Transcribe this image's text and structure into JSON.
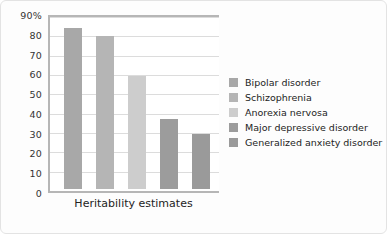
{
  "chart_data": {
    "type": "bar",
    "title": "",
    "xlabel": "Heritability estimates",
    "ylabel": "",
    "ylim": [
      0,
      90
    ],
    "grid": true,
    "legend_position": "right",
    "categories": [
      "Bipolar disorder",
      "Schizophrenia",
      "Anorexia nervosa",
      "Major depressive disorder",
      "Generalized anxiety disorder"
    ],
    "values": [
      85,
      81,
      60,
      37,
      29
    ],
    "ytick_labels": [
      "90%",
      "80",
      "70",
      "60",
      "50",
      "40",
      "30",
      "20",
      "10",
      "0"
    ],
    "ytick_values": [
      90,
      80,
      70,
      60,
      50,
      40,
      30,
      20,
      10,
      0
    ],
    "bar_colors": [
      "#a8a8a8",
      "#b5b5b5",
      "#cdcdcd",
      "#9c9c9c",
      "#9a9a9a"
    ],
    "legend": [
      {
        "label": "Bipolar disorder",
        "color": "#a8a8a8"
      },
      {
        "label": "Schizophrenia",
        "color": "#b5b5b5"
      },
      {
        "label": "Anorexia nervosa",
        "color": "#cdcdcd"
      },
      {
        "label": "Major depressive disorder",
        "color": "#9c9c9c"
      },
      {
        "label": "Generalized anxiety disorder",
        "color": "#9a9a9a"
      }
    ]
  }
}
